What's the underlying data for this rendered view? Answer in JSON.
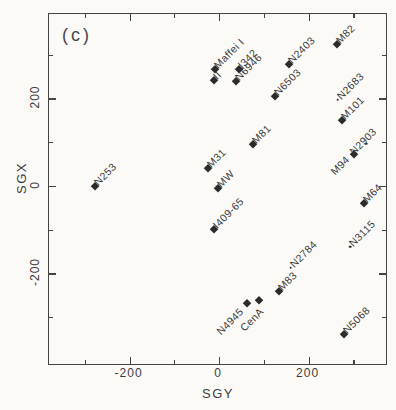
{
  "figure": {
    "panel_label": "(c)",
    "ink_color": "#3c3c3c",
    "marker_color": "#2b2b2b",
    "background_color": "#fbfaf7"
  },
  "chart_data": {
    "type": "scatter",
    "title": "",
    "xlabel": "SGY",
    "ylabel": "SGX",
    "xlim": [
      -380,
      373
    ],
    "ylim": [
      -407,
      393
    ],
    "grid": false,
    "legend": "none",
    "xticks": [
      {
        "value": -300,
        "major": false
      },
      {
        "value": -200,
        "major": true,
        "label": "-200"
      },
      {
        "value": -100,
        "major": false
      },
      {
        "value": 0,
        "major": true,
        "label": "0"
      },
      {
        "value": 100,
        "major": false
      },
      {
        "value": 200,
        "major": true,
        "label": "200"
      },
      {
        "value": 300,
        "major": false
      }
    ],
    "yticks": [
      {
        "value": -300,
        "major": false
      },
      {
        "value": -200,
        "major": true,
        "label": "-200"
      },
      {
        "value": -100,
        "major": false
      },
      {
        "value": 0,
        "major": true,
        "label": "0"
      },
      {
        "value": 100,
        "major": false
      },
      {
        "value": 200,
        "major": true,
        "label": "200"
      },
      {
        "value": 300,
        "major": false
      }
    ],
    "points": [
      {
        "name": "N253",
        "sgy": -278,
        "sgx": 0,
        "marker": "diamond",
        "label_side": "ne"
      },
      {
        "name": "Maffei I",
        "sgy": -10,
        "sgx": 268,
        "marker": "diamond",
        "label_side": "ne"
      },
      {
        "name": "II",
        "sgy": -12,
        "sgx": 243,
        "marker": "diamond",
        "label_side": "ne"
      },
      {
        "name": "I342",
        "sgy": 44,
        "sgx": 267,
        "marker": "diamond",
        "label_side": "ne"
      },
      {
        "name": "N6946",
        "sgy": 38,
        "sgx": 240,
        "marker": "diamond",
        "label_side": "ne"
      },
      {
        "name": "N6503",
        "sgy": 125,
        "sgx": 205,
        "marker": "diamond",
        "label_side": "ne"
      },
      {
        "name": "N2403",
        "sgy": 157,
        "sgx": 278,
        "marker": "diamond",
        "label_side": "ne"
      },
      {
        "name": "M82",
        "sgy": 263,
        "sgx": 324,
        "marker": "diamond",
        "label_side": "ne"
      },
      {
        "name": "N2683",
        "sgy": 265,
        "sgx": 197,
        "marker": "dot",
        "label_side": "ne"
      },
      {
        "name": "M101",
        "sgy": 274,
        "sgx": 151,
        "marker": "diamond",
        "label_side": "ne"
      },
      {
        "name": "N2903",
        "sgy": 329,
        "sgx": 97,
        "marker": "dot",
        "label_side": "sw",
        "ldx": 12,
        "ldy": -16
      },
      {
        "name": "M94",
        "sgy": 302,
        "sgx": 72,
        "marker": "diamond",
        "label_side": "sw",
        "ldx": -3,
        "ldy": 2
      },
      {
        "name": "M64",
        "sgy": 323,
        "sgx": -40,
        "marker": "diamond",
        "label_side": "ne"
      },
      {
        "name": "M81",
        "sgy": 75,
        "sgx": 97,
        "marker": "diamond",
        "label_side": "ne"
      },
      {
        "name": "M31",
        "sgy": -24,
        "sgx": 40,
        "marker": "diamond",
        "label_side": "ne"
      },
      {
        "name": "MW",
        "sgy": -3,
        "sgx": -5,
        "marker": "diamond",
        "label_side": "ne"
      },
      {
        "name": "I409-65",
        "sgy": -11,
        "sgx": -99,
        "marker": "diamond",
        "label_side": "ne"
      },
      {
        "name": "N2784",
        "sgy": 160,
        "sgx": -187,
        "marker": "dot",
        "label_side": "ne"
      },
      {
        "name": "M83",
        "sgy": 135,
        "sgx": -240,
        "marker": "diamond",
        "label_side": "ne"
      },
      {
        "name": "CenA",
        "sgy": 89,
        "sgx": -261,
        "marker": "diamond",
        "label_side": "sw",
        "ldx": 6,
        "ldy": 8
      },
      {
        "name": "N4945",
        "sgy": 62,
        "sgx": -267,
        "marker": "diamond",
        "label_side": "sw",
        "ldx": -2,
        "ldy": 5
      },
      {
        "name": "N3115",
        "sgy": 293,
        "sgx": -139,
        "marker": "dot",
        "label_side": "ne"
      },
      {
        "name": "N5068",
        "sgy": 280,
        "sgx": -339,
        "marker": "diamond",
        "label_side": "ne"
      }
    ]
  }
}
